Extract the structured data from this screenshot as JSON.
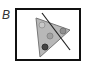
{
  "panel": {
    "label": "B",
    "frame": {
      "x": 16,
      "y": 9,
      "width": 64,
      "height": 51,
      "stroke": "#111111"
    },
    "triangle": {
      "points": "36,18 70,30 40,57",
      "fill": "#b8b8b8",
      "stroke": "#777777"
    },
    "line": {
      "x1": 42,
      "y1": 13,
      "x2": 70,
      "y2": 50,
      "stroke": "#222222"
    },
    "circles": [
      {
        "cx": 42,
        "cy": 25,
        "r": 3,
        "fill": "#c8c8c8",
        "stroke": "#999999"
      },
      {
        "cx": 50,
        "cy": 36,
        "r": 3,
        "fill": "#a0a0a0",
        "stroke": "#888888"
      },
      {
        "cx": 63,
        "cy": 31,
        "r": 3,
        "fill": "#909090",
        "stroke": "#777777"
      },
      {
        "cx": 45,
        "cy": 47,
        "r": 3,
        "fill": "#444444",
        "stroke": "#333333"
      }
    ]
  }
}
